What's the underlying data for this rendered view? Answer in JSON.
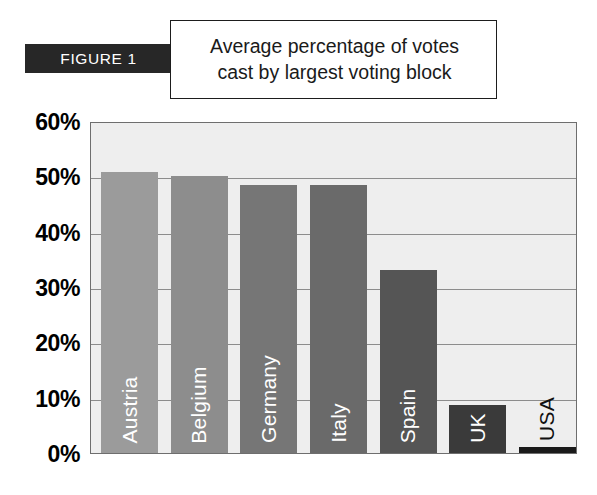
{
  "figure": {
    "badge_label": "FIGURE 1",
    "title_line1": "Average percentage of votes",
    "title_line2": "cast by largest voting block"
  },
  "colors": {
    "badge_background": "#272727",
    "plot_background": "#eeeeee",
    "plot_border": "#6e6e6e",
    "gridline": "#8c8c8c",
    "axis_text": "#000000"
  },
  "chart_data": {
    "type": "bar",
    "title": "Average percentage of votes cast by largest voting block",
    "xlabel": "",
    "ylabel": "",
    "ylim": [
      0,
      60
    ],
    "yticks": [
      0,
      10,
      20,
      30,
      40,
      50,
      60
    ],
    "ytick_labels": [
      "0%",
      "10%",
      "20%",
      "30%",
      "40%",
      "50%",
      "60%"
    ],
    "grid": true,
    "legend": "none",
    "categories": [
      "Austria",
      "Belgium",
      "Germany",
      "Italy",
      "Spain",
      "UK",
      "USA"
    ],
    "values": [
      50.8,
      50.0,
      48.5,
      48.5,
      33.0,
      8.7,
      1.0
    ],
    "bar_colors": [
      "#9b9b9b",
      "#8d8d8d",
      "#767676",
      "#6a6a6a",
      "#555555",
      "#3a3a3a",
      "#1a1a1a"
    ],
    "label_positions": [
      "inside",
      "inside",
      "inside",
      "inside",
      "inside",
      "inside",
      "outside"
    ]
  }
}
